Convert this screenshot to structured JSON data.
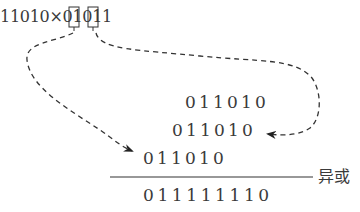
{
  "equation": {
    "text": "11010×01011",
    "highlighted_bits": [
      "1",
      "1"
    ],
    "highlighted_positions": [
      2,
      4
    ]
  },
  "partial_products": [
    {
      "value": "011010",
      "label": "row-1"
    },
    {
      "value": "011010",
      "label": "row-2"
    },
    {
      "value": "011010",
      "label": "row-3"
    }
  ],
  "result": {
    "value": "011111110"
  },
  "operation_label": "异或",
  "arrows": [
    {
      "from": "highlighted-bit-1",
      "to": "row-3",
      "style": "dashed"
    },
    {
      "from": "highlighted-bit-2",
      "to": "row-2",
      "style": "dashed"
    }
  ],
  "colors": {
    "text": "#3a3a3a",
    "line": "#333333",
    "background": "#ffffff"
  }
}
